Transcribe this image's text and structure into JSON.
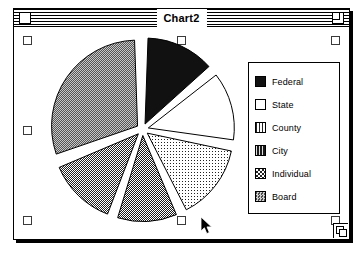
{
  "window": {
    "title": "Chart2",
    "close_box": "close-box",
    "zoom_box": "zoom-box",
    "grow_box": "grow-box"
  },
  "chart_data": {
    "type": "pie",
    "title": "Chart2",
    "exploded": true,
    "legend_position": "right",
    "categories": [
      "Federal",
      "State",
      "County",
      "City",
      "Individual",
      "Board"
    ],
    "values": [
      14,
      14,
      15,
      12,
      14,
      31
    ],
    "angles_deg": [
      50,
      50,
      55,
      44,
      50,
      111
    ],
    "patterns": [
      "solid-black",
      "white",
      "light-dots",
      "dark-dither",
      "checkerboard",
      "medium-gray"
    ],
    "colors": [
      "#111111",
      "#ffffff",
      "#d0d0d0",
      "#4a4a4a",
      "#9a9a9a",
      "#808080"
    ],
    "xlabel": "",
    "ylabel": ""
  },
  "legend": {
    "items": [
      {
        "label": "Federal"
      },
      {
        "label": "State"
      },
      {
        "label": "County"
      },
      {
        "label": "City"
      },
      {
        "label": "Individual"
      },
      {
        "label": "Board"
      }
    ]
  },
  "selection": {
    "handle_count": 8
  },
  "cursor": {
    "icon": "arrow-pointer"
  }
}
